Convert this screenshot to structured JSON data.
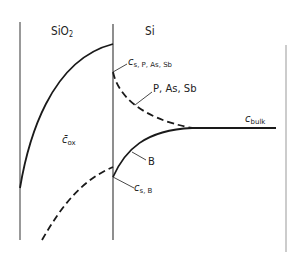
{
  "regions": {
    "oxide": {
      "label": "SiO",
      "subscript": "2"
    },
    "silicon": {
      "label": "Si"
    }
  },
  "labels": {
    "c_oxide": {
      "symbol": "c̄",
      "subscript": "ox"
    },
    "c_surface_n": {
      "symbol": "c",
      "subscript": "s, P, As, Sb"
    },
    "n_type_curve": {
      "text": "P, As, Sb"
    },
    "p_type_curve": {
      "text": "B"
    },
    "c_surface_p": {
      "symbol": "c",
      "subscript": "s, B"
    },
    "c_bulk": {
      "symbol": "c",
      "subscript": "bulk"
    }
  },
  "curves": [
    {
      "name": "n-type dopants (P, As, Sb) in Si",
      "style": "dashed",
      "region": "Si",
      "behavior": "piles up at interface (c_s > c_bulk), decays to c_bulk"
    },
    {
      "name": "boron in Si",
      "style": "solid",
      "region": "Si",
      "behavior": "depleted at interface (c_s < c_bulk), rises to c_bulk"
    },
    {
      "name": "boron in SiO2",
      "style": "solid",
      "region": "SiO2",
      "behavior": "high at interface, falls off into oxide"
    },
    {
      "name": "n-type dopants in SiO2",
      "style": "dashed",
      "region": "SiO2",
      "behavior": "low at interface, falls off into oxide"
    },
    {
      "name": "bulk concentration",
      "style": "solid",
      "region": "Si",
      "behavior": "constant c_bulk"
    }
  ],
  "colors": {
    "line": "#1a1a1a",
    "boundary": "#555555",
    "text": "#222222"
  }
}
